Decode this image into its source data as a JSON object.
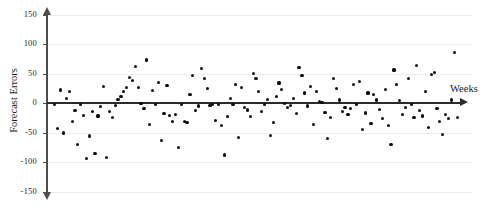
{
  "chart_data": {
    "type": "scatter",
    "title": "",
    "xlabel": "Weeks",
    "ylabel": "Forecast Errors",
    "ylim": [
      -150,
      150
    ],
    "xlim": [
      0,
      142
    ],
    "yticks": [
      150,
      100,
      50,
      0,
      -50,
      -100,
      -150
    ],
    "ytick_labels": [
      "150",
      "100",
      "50",
      "0",
      "-50",
      "-100",
      "-150"
    ],
    "xticks": [],
    "xtick_labels": [],
    "grid": true,
    "grid_axis": "y",
    "legend": null,
    "marker": "filled-circle",
    "marker_color": "#0d0d0d",
    "axis_color": "#2b2b2b",
    "zero_line": true,
    "points": [
      [
        1,
        -3
      ],
      [
        2,
        -43
      ],
      [
        3,
        22
      ],
      [
        4,
        -51
      ],
      [
        5,
        8
      ],
      [
        6,
        19
      ],
      [
        7,
        -32
      ],
      [
        8,
        -13
      ],
      [
        9,
        -71
      ],
      [
        10,
        -3
      ],
      [
        11,
        -21
      ],
      [
        12,
        -94
      ],
      [
        13,
        -56
      ],
      [
        14,
        -14
      ],
      [
        15,
        -86
      ],
      [
        16,
        -22
      ],
      [
        17,
        -6
      ],
      [
        18,
        28
      ],
      [
        19,
        -93
      ],
      [
        20,
        -14
      ],
      [
        21,
        -25
      ],
      [
        22,
        -4
      ],
      [
        23,
        6
      ],
      [
        24,
        11
      ],
      [
        25,
        19
      ],
      [
        26,
        26
      ],
      [
        27,
        43
      ],
      [
        28,
        38
      ],
      [
        29,
        62
      ],
      [
        30,
        26
      ],
      [
        31,
        -1
      ],
      [
        32,
        -10
      ],
      [
        33,
        73
      ],
      [
        34,
        -36
      ],
      [
        35,
        21
      ],
      [
        36,
        -2
      ],
      [
        37,
        35
      ],
      [
        38,
        -64
      ],
      [
        39,
        -18
      ],
      [
        40,
        30
      ],
      [
        41,
        -21
      ],
      [
        42,
        -31
      ],
      [
        43,
        -20
      ],
      [
        44,
        -76
      ],
      [
        45,
        -3
      ],
      [
        46,
        -31
      ],
      [
        47,
        -33
      ],
      [
        48,
        15
      ],
      [
        49,
        46
      ],
      [
        50,
        -13
      ],
      [
        51,
        -5
      ],
      [
        52,
        58
      ],
      [
        53,
        41
      ],
      [
        54,
        25
      ],
      [
        55,
        -4
      ],
      [
        56,
        -2
      ],
      [
        57,
        -30
      ],
      [
        58,
        -2
      ],
      [
        59,
        -38
      ],
      [
        60,
        -88
      ],
      [
        61,
        -23
      ],
      [
        62,
        7
      ],
      [
        63,
        -2
      ],
      [
        64,
        32
      ],
      [
        65,
        -59
      ],
      [
        66,
        26
      ],
      [
        67,
        -8
      ],
      [
        68,
        -12
      ],
      [
        69,
        -23
      ],
      [
        70,
        50
      ],
      [
        71,
        42
      ],
      [
        72,
        20
      ],
      [
        73,
        -14
      ],
      [
        74,
        -3
      ],
      [
        75,
        6
      ],
      [
        76,
        -55
      ],
      [
        77,
        -33
      ],
      [
        78,
        11
      ],
      [
        79,
        34
      ],
      [
        80,
        23
      ],
      [
        81,
        -1
      ],
      [
        82,
        -7
      ],
      [
        83,
        -4
      ],
      [
        84,
        7
      ],
      [
        85,
        -18
      ],
      [
        86,
        60
      ],
      [
        87,
        46
      ],
      [
        88,
        17
      ],
      [
        89,
        -5
      ],
      [
        90,
        28
      ],
      [
        91,
        -36
      ],
      [
        92,
        20
      ],
      [
        93,
        3
      ],
      [
        94,
        1
      ],
      [
        95,
        -16
      ],
      [
        96,
        -60
      ],
      [
        97,
        -25
      ],
      [
        98,
        41
      ],
      [
        99,
        25
      ],
      [
        100,
        5
      ],
      [
        101,
        -14
      ],
      [
        102,
        -7
      ],
      [
        103,
        -20
      ],
      [
        104,
        -9
      ],
      [
        105,
        31
      ],
      [
        106,
        -2
      ],
      [
        107,
        36
      ],
      [
        108,
        -45
      ],
      [
        109,
        -17
      ],
      [
        110,
        17
      ],
      [
        111,
        -35
      ],
      [
        112,
        14
      ],
      [
        113,
        5
      ],
      [
        114,
        -11
      ],
      [
        115,
        -26
      ],
      [
        116,
        23
      ],
      [
        117,
        -38
      ],
      [
        118,
        -70
      ],
      [
        119,
        56
      ],
      [
        120,
        31
      ],
      [
        121,
        4
      ],
      [
        122,
        -19
      ],
      [
        123,
        -8
      ],
      [
        124,
        41
      ],
      [
        125,
        -2
      ],
      [
        126,
        -25
      ],
      [
        127,
        64
      ],
      [
        128,
        -13
      ],
      [
        129,
        -22
      ],
      [
        130,
        19
      ],
      [
        131,
        -42
      ],
      [
        132,
        48
      ],
      [
        133,
        52
      ],
      [
        134,
        -9
      ],
      [
        135,
        -31
      ],
      [
        136,
        -54
      ],
      [
        137,
        -20
      ],
      [
        138,
        -26
      ],
      [
        139,
        5
      ],
      [
        140,
        86
      ],
      [
        141,
        -24
      ]
    ]
  },
  "axes": {
    "y_title": "Forecast Errors",
    "x_title": "Weeks"
  }
}
